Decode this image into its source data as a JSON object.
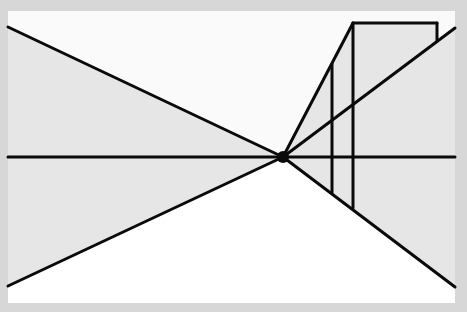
{
  "diagram": {
    "title": "One-point perspective drawing",
    "colors": {
      "frame": "#d7d7d7",
      "sky": "#fafafa",
      "wall": "#e6e6e6",
      "ground": "#ffffff",
      "line": "#0a0a0a"
    },
    "vanishing_point": {
      "x": 283,
      "y": 157,
      "radius": 6
    },
    "horizon_line": {
      "x1": 8,
      "y1": 157,
      "x2": 455,
      "y2": 157
    },
    "orthogonals": [
      {
        "name": "upper-left",
        "x1": 8,
        "y1": 27,
        "x2": 283,
        "y2": 157
      },
      {
        "name": "lower-left",
        "x1": 8,
        "y1": 286,
        "x2": 283,
        "y2": 157
      },
      {
        "name": "lower-right",
        "x1": 283,
        "y1": 157,
        "x2": 455,
        "y2": 287
      },
      {
        "name": "upper-right",
        "x1": 283,
        "y1": 157,
        "x2": 455,
        "y2": 28
      },
      {
        "name": "building-top",
        "x1": 283,
        "y1": 157,
        "x2": 353,
        "y2": 23
      }
    ],
    "building": {
      "near_vertical": {
        "x": 353,
        "y1": 23,
        "y2": 208
      },
      "far_vertical": {
        "x": 332,
        "y1": 64,
        "y2": 193
      },
      "top_edge": {
        "x1": 353,
        "y1": 23,
        "x2": 437,
        "y2": 23
      },
      "right_stub": {
        "x": 437,
        "y1": 23,
        "y2": 41
      }
    }
  }
}
